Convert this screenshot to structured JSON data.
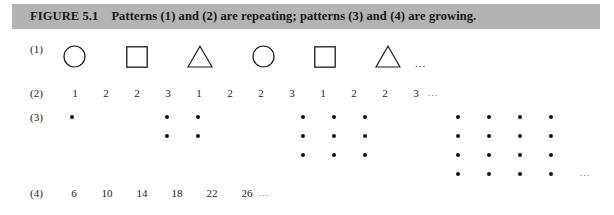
{
  "figure": {
    "label": "FIGURE 5.1",
    "caption": "Patterns (1) and (2) are repeating; patterns (3) and (4) are growing.",
    "bar_color": "#b3b3b3",
    "ink_color": "#1a1a1a"
  },
  "rows": [
    {
      "label": "(1)",
      "kind": "shapes",
      "items": [
        "circle",
        "square",
        "triangle",
        "circle",
        "square",
        "triangle"
      ],
      "trailing": "..."
    },
    {
      "label": "(2)",
      "kind": "numbers",
      "items": [
        "1",
        "2",
        "2",
        "3",
        "1",
        "2",
        "2",
        "3",
        "1",
        "2",
        "2",
        "3"
      ],
      "trailing": "..."
    },
    {
      "label": "(3)",
      "kind": "dots",
      "groups": [
        1,
        2,
        3,
        4
      ],
      "group_counts": [
        "1",
        "4",
        "9",
        "16"
      ],
      "trailing": "..."
    },
    {
      "label": "(4)",
      "kind": "numbers",
      "items": [
        "6",
        "10",
        "14",
        "18",
        "22",
        "26"
      ],
      "trailing": "..."
    }
  ]
}
